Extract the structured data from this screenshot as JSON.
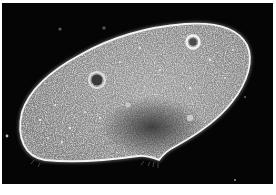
{
  "image": {
    "subject": "paramecium micrograph",
    "description": "Dark-field micrograph of a paramecium: an elongated oval cell with bright outline on black background, granular interior, two contractile vacuoles and an oral groove notch on the lower edge",
    "colors": {
      "background": "#050505",
      "cell_body": "#8a8a8a",
      "cell_outline": "#f2f2f2",
      "dark_region": "#3a3a3a",
      "page": "#ffffff"
    },
    "features": [
      {
        "name": "contractile-vacuole-left",
        "cx": 97,
        "cy": 80
      },
      {
        "name": "contractile-vacuole-right",
        "cx": 193,
        "cy": 42
      },
      {
        "name": "oral-groove",
        "cx": 158,
        "cy": 156
      },
      {
        "name": "macronucleus-dark-region",
        "cx": 150,
        "cy": 125
      }
    ]
  },
  "caption": {
    "text": ""
  }
}
